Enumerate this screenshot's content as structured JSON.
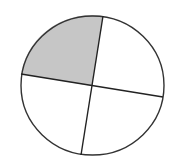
{
  "diagram": {
    "type": "fraction-circle",
    "parts_total": 4,
    "parts_shaded": 1,
    "fraction_label": "1/4",
    "colors": {
      "background": "#ffffff",
      "outline": "#333333",
      "shaded_fill": "#c6c6c6",
      "unshaded_fill": "#ffffff"
    },
    "geometry": {
      "center": [
        92,
        86
      ],
      "rx": 71.5,
      "ry": 69.5,
      "circle_center": [
        92.5,
        85.5
      ],
      "spoke_ends": {
        "top": [
          103,
          16
        ],
        "right": [
          163,
          97
        ],
        "bottom": [
          81,
          155
        ],
        "left": [
          21,
          74
        ]
      }
    },
    "sections": [
      {
        "position": "top-left",
        "shaded": true
      },
      {
        "position": "top-right",
        "shaded": false
      },
      {
        "position": "bottom-right",
        "shaded": false
      },
      {
        "position": "bottom-left",
        "shaded": false
      }
    ]
  }
}
